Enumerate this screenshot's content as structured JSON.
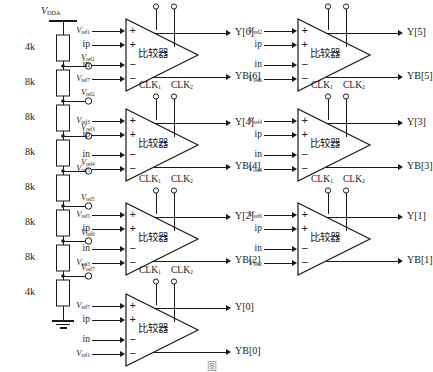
{
  "figure": {
    "caption": "图",
    "supply_label": "V",
    "supply_sub": "DDA",
    "comparator_name": "比较器",
    "clk1": "CLK",
    "clk1_sub": "1",
    "clk2": "CLK",
    "clk2_sub": "2",
    "plus": "+",
    "minus": "−",
    "vref_prefix": "V",
    "in_p_label": "ip",
    "in_n_label": "in"
  },
  "ladder": {
    "top_node": "V_DDA",
    "resistors": [
      {
        "value": "4k"
      },
      {
        "value": "8k"
      },
      {
        "value": "8k"
      },
      {
        "value": "8k"
      },
      {
        "value": "8k"
      },
      {
        "value": "8k"
      },
      {
        "value": "8k"
      },
      {
        "value": "4k"
      }
    ],
    "taps": [
      {
        "name": "V",
        "sub": "ref1"
      },
      {
        "name": "V",
        "sub": "ref2"
      },
      {
        "name": "V",
        "sub": "ref3"
      },
      {
        "name": "V",
        "sub": "ref4"
      },
      {
        "name": "V",
        "sub": "ref5"
      },
      {
        "name": "V",
        "sub": "ref6"
      },
      {
        "name": "V",
        "sub": "ref7"
      }
    ],
    "bottom_node": "GND"
  },
  "comparators": [
    {
      "id": "cmp6",
      "inputs": [
        {
          "label": "V",
          "sub": "ref1",
          "sign": "+",
          "italic": true
        },
        {
          "label": "ip",
          "sub": "",
          "sign": "+",
          "italic": false
        },
        {
          "label": "in",
          "sub": "",
          "sign": "−",
          "italic": false
        },
        {
          "label": "V",
          "sub": "ref7",
          "sign": "−",
          "italic": true
        }
      ],
      "outputs": [
        {
          "label": "Y[6]"
        },
        {
          "label": "YB[6]"
        }
      ]
    },
    {
      "id": "cmp5",
      "inputs": [
        {
          "label": "V",
          "sub": "ref2",
          "sign": "+",
          "italic": true
        },
        {
          "label": "ip",
          "sub": "",
          "sign": "+",
          "italic": false
        },
        {
          "label": "in",
          "sub": "",
          "sign": "−",
          "italic": false
        },
        {
          "label": "V",
          "sub": "ref6",
          "sign": "−",
          "italic": true
        }
      ],
      "outputs": [
        {
          "label": "Y[5]"
        },
        {
          "label": "YB[5]"
        }
      ]
    },
    {
      "id": "cmp4",
      "inputs": [
        {
          "label": "V",
          "sub": "ref3",
          "sign": "+",
          "italic": true
        },
        {
          "label": "ip",
          "sub": "",
          "sign": "+",
          "italic": false
        },
        {
          "label": "in",
          "sub": "",
          "sign": "−",
          "italic": false
        },
        {
          "label": "V",
          "sub": "ref5",
          "sign": "−",
          "italic": true
        }
      ],
      "outputs": [
        {
          "label": "Y[4]"
        },
        {
          "label": "YB[4]"
        }
      ]
    },
    {
      "id": "cmp3",
      "inputs": [
        {
          "label": "V",
          "sub": "ref4",
          "sign": "+",
          "italic": true
        },
        {
          "label": "ip",
          "sub": "",
          "sign": "+",
          "italic": false
        },
        {
          "label": "in",
          "sub": "",
          "sign": "−",
          "italic": false
        },
        {
          "label": "V",
          "sub": "ref4",
          "sign": "−",
          "italic": true
        }
      ],
      "outputs": [
        {
          "label": "Y[3]"
        },
        {
          "label": "YB[3]"
        }
      ]
    },
    {
      "id": "cmp2",
      "inputs": [
        {
          "label": "V",
          "sub": "ref5",
          "sign": "+",
          "italic": true
        },
        {
          "label": "ip",
          "sub": "",
          "sign": "+",
          "italic": false
        },
        {
          "label": "in",
          "sub": "",
          "sign": "−",
          "italic": false
        },
        {
          "label": "V",
          "sub": "ref3",
          "sign": "−",
          "italic": true
        }
      ],
      "outputs": [
        {
          "label": "Y[2]"
        },
        {
          "label": "YB[2]"
        }
      ]
    },
    {
      "id": "cmp1",
      "inputs": [
        {
          "label": "V",
          "sub": "ref6",
          "sign": "+",
          "italic": true
        },
        {
          "label": "ip",
          "sub": "",
          "sign": "+",
          "italic": false
        },
        {
          "label": "in",
          "sub": "",
          "sign": "−",
          "italic": false
        },
        {
          "label": "V",
          "sub": "ref2",
          "sign": "−",
          "italic": true
        }
      ],
      "outputs": [
        {
          "label": "Y[1]"
        },
        {
          "label": "YB[1]"
        }
      ]
    },
    {
      "id": "cmp0",
      "inputs": [
        {
          "label": "V",
          "sub": "ref7",
          "sign": "+",
          "italic": true
        },
        {
          "label": "ip",
          "sub": "",
          "sign": "+",
          "italic": false
        },
        {
          "label": "in",
          "sub": "",
          "sign": "−",
          "italic": false
        },
        {
          "label": "V",
          "sub": "ref1",
          "sign": "−",
          "italic": true
        }
      ],
      "outputs": [
        {
          "label": "Y[0]"
        },
        {
          "label": "YB[0]"
        }
      ]
    }
  ],
  "colors": {
    "line": "#1a1a1a",
    "text": "#1a1a1a",
    "background": "#ffffff"
  }
}
